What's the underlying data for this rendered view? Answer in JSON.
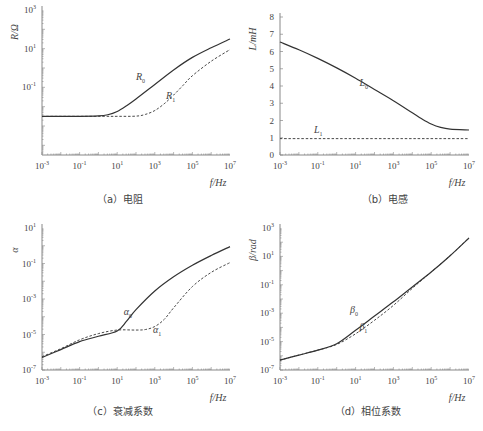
{
  "chart_data": [
    {
      "id": "a",
      "type": "line",
      "caption": "（a）电阻",
      "title": "",
      "xlabel": "f/Hz",
      "ylabel": "R/Ω",
      "xscale": "log",
      "yscale": "log",
      "xlim_exp": [
        -3,
        7
      ],
      "ylim_exp": [
        -4.5,
        3
      ],
      "x_ticks": [
        "10^-3",
        "10^-1",
        "10^1",
        "10^3",
        "10^5",
        "10^7"
      ],
      "y_ticks": [
        "10^-1",
        "10^1",
        "10^3"
      ],
      "grid": false,
      "series": [
        {
          "name": "R0",
          "style": "solid",
          "log_x": [
            -3,
            -1,
            0,
            0.5,
            1,
            1.5,
            2,
            3,
            4,
            5,
            6,
            7
          ],
          "log_y": [
            -2.5,
            -2.5,
            -2.48,
            -2.42,
            -2.25,
            -1.95,
            -1.6,
            -0.85,
            -0.1,
            0.55,
            1.05,
            1.5
          ],
          "label_pos": [
            2,
            -0.6
          ]
        },
        {
          "name": "R1",
          "style": "dashed",
          "log_x": [
            -3,
            0,
            1,
            2,
            2.5,
            3,
            3.5,
            4,
            4.5,
            5,
            6,
            7
          ],
          "log_y": [
            -2.5,
            -2.5,
            -2.5,
            -2.49,
            -2.4,
            -2.2,
            -1.85,
            -1.4,
            -0.9,
            -0.4,
            0.35,
            0.95
          ],
          "label_pos": [
            3.6,
            -1.6
          ]
        }
      ]
    },
    {
      "id": "b",
      "type": "line",
      "caption": "（b）电感",
      "title": "",
      "xlabel": "f/Hz",
      "ylabel": "L/mH",
      "xscale": "log",
      "yscale": "linear",
      "xlim_exp": [
        -3,
        7
      ],
      "ylim": [
        0,
        8
      ],
      "x_ticks": [
        "10^-3",
        "10^-1",
        "10^1",
        "10^3",
        "10^5",
        "10^7"
      ],
      "y_ticks": [
        "0",
        "1",
        "2",
        "3",
        "4",
        "5",
        "6",
        "7",
        "8"
      ],
      "grid": false,
      "series": [
        {
          "name": "L0",
          "style": "solid",
          "log_x": [
            -3,
            -2,
            -1,
            0,
            1,
            2,
            3,
            4,
            4.5,
            5,
            5.5,
            6,
            7
          ],
          "y": [
            6.55,
            6.1,
            5.6,
            5.05,
            4.45,
            3.8,
            3.15,
            2.45,
            2.1,
            1.8,
            1.6,
            1.5,
            1.45
          ],
          "label_pos": [
            1.2,
            4.0
          ]
        },
        {
          "name": "L1",
          "style": "dashed",
          "log_x": [
            -3,
            7
          ],
          "y": [
            0.95,
            0.95
          ],
          "label_pos": [
            -1.2,
            1.3
          ]
        }
      ]
    },
    {
      "id": "c",
      "type": "line",
      "caption": "（c）衰减系数",
      "title": "",
      "xlabel": "f/Hz",
      "ylabel": "α",
      "xscale": "log",
      "yscale": "log",
      "xlim_exp": [
        -3,
        7
      ],
      "ylim_exp": [
        -7,
        1
      ],
      "x_ticks": [
        "10^-3",
        "10^-1",
        "10^1",
        "10^3",
        "10^5",
        "10^7"
      ],
      "y_ticks": [
        "10^-7",
        "10^-5",
        "10^-3",
        "10^-1",
        "10^1"
      ],
      "grid": false,
      "series": [
        {
          "name": "α0",
          "style": "solid",
          "log_x": [
            -3,
            -2,
            -1,
            0,
            1,
            1.5,
            2,
            3,
            4,
            5,
            6,
            7
          ],
          "log_y": [
            -6.3,
            -5.85,
            -5.4,
            -5.1,
            -4.8,
            -4.25,
            -3.6,
            -2.55,
            -1.75,
            -1.1,
            -0.55,
            -0.05
          ],
          "label_pos": [
            1.35,
            -3.9
          ]
        },
        {
          "name": "α1",
          "style": "dashed",
          "log_x": [
            -3,
            -2,
            -1,
            0,
            1,
            2,
            2.5,
            3,
            3.5,
            4,
            5,
            6,
            7
          ],
          "log_y": [
            -6.25,
            -5.8,
            -5.3,
            -4.95,
            -4.75,
            -4.75,
            -4.72,
            -4.55,
            -4.15,
            -3.5,
            -2.3,
            -1.5,
            -0.95
          ],
          "label_pos": [
            2.9,
            -4.9
          ]
        }
      ]
    },
    {
      "id": "d",
      "type": "line",
      "caption": "（d）相位系数",
      "title": "",
      "xlabel": "f/Hz",
      "ylabel": "β/rad",
      "xscale": "log",
      "yscale": "log",
      "xlim_exp": [
        -3,
        7
      ],
      "ylim_exp": [
        -7,
        3
      ],
      "x_ticks": [
        "10^-3",
        "10^-1",
        "10^1",
        "10^3",
        "10^5",
        "10^7"
      ],
      "y_ticks": [
        "10^-7",
        "10^-5",
        "10^-3",
        "10^-1",
        "10^1",
        "10^3"
      ],
      "grid": false,
      "series": [
        {
          "name": "β0",
          "style": "solid",
          "log_x": [
            -3,
            -2,
            -1,
            0,
            1,
            2,
            3,
            4,
            5,
            6,
            7
          ],
          "log_y": [
            -6.3,
            -5.95,
            -5.6,
            -5.15,
            -4.2,
            -3.2,
            -2.2,
            -1.15,
            -0.1,
            1.05,
            2.3
          ],
          "label_pos": [
            0.7,
            -3.0
          ]
        },
        {
          "name": "β1",
          "style": "dashed",
          "log_x": [
            -3,
            -2,
            -1,
            0,
            1,
            2,
            3,
            4,
            5,
            6,
            7
          ],
          "log_y": [
            -6.3,
            -5.95,
            -5.6,
            -5.2,
            -4.45,
            -3.5,
            -2.45,
            -1.25,
            -0.1,
            1.05,
            2.3
          ],
          "label_pos": [
            1.2,
            -4.2
          ]
        }
      ]
    }
  ],
  "layout": {
    "panels": [
      {
        "id": "a",
        "left": 42,
        "top": 10,
        "right": 230,
        "bottom": 155
      },
      {
        "id": "b",
        "left": 280,
        "top": 17,
        "right": 469,
        "bottom": 155
      },
      {
        "id": "c",
        "left": 42,
        "top": 228,
        "right": 230,
        "bottom": 370
      },
      {
        "id": "d",
        "left": 280,
        "top": 228,
        "right": 469,
        "bottom": 370
      }
    ],
    "line_color": "#333333",
    "axis_color": "#888888"
  }
}
